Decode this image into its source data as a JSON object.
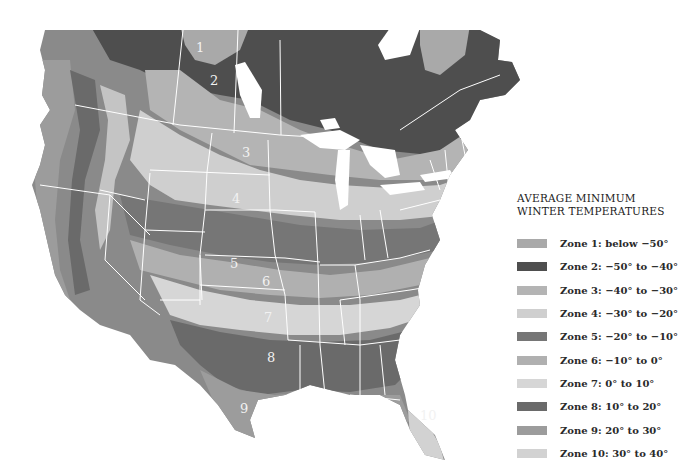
{
  "legend": {
    "title_line1": "AVERAGE MINIMUM",
    "title_line2": "WINTER TEMPERATURES",
    "items": [
      {
        "label": "Zone 1: below −50°",
        "color": "#a9a9a9"
      },
      {
        "label": "Zone 2: −50° to −40°",
        "color": "#4e4e4e"
      },
      {
        "label": "Zone 3: −40° to −30°",
        "color": "#b4b4b4"
      },
      {
        "label": "Zone 4: −30° to −20°",
        "color": "#cfcfcf"
      },
      {
        "label": "Zone 5: −20° to −10°",
        "color": "#767676"
      },
      {
        "label": "Zone 6: −10° to 0°",
        "color": "#b0b0b0"
      },
      {
        "label": "Zone 7: 0° to 10°",
        "color": "#d6d6d6"
      },
      {
        "label": "Zone 8: 10° to 20°",
        "color": "#6a6a6a"
      },
      {
        "label": "Zone 9: 20° to 30°",
        "color": "#9c9c9c"
      },
      {
        "label": "Zone 10: 30° to 40°",
        "color": "#d2d2d2"
      }
    ]
  },
  "map": {
    "zone_numbers": [
      "1",
      "2",
      "3",
      "4",
      "5",
      "6",
      "7",
      "8",
      "9",
      "10"
    ],
    "border_color": "#ffffff",
    "water_color": "#ffffff"
  }
}
